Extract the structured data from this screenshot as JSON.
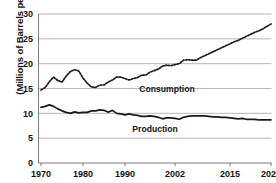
{
  "chart_data": {
    "type": "line",
    "title": "",
    "xlabel": "",
    "ylabel": "(Millions of Barrels per Day)",
    "ylim": [
      0,
      30
    ],
    "yticks": [
      0,
      5,
      10,
      15,
      20,
      25,
      30
    ],
    "ytick_labels": [
      "0",
      "5",
      "10",
      "15",
      "20",
      "25",
      "30"
    ],
    "xticks": [
      1970,
      1980,
      1990,
      2002,
      2015,
      2025
    ],
    "xtick_labels": [
      "1970",
      "1980",
      "1990",
      "2002",
      "2015",
      "2025"
    ],
    "xlim": [
      1970,
      2025
    ],
    "grid": "horizontal",
    "legend_position": "inline-annotation",
    "series": [
      {
        "name": "Consumption",
        "style": "dotted",
        "color": "#1a1a1a",
        "annotation": "Consumption",
        "x": [
          1970,
          1971,
          1972,
          1973,
          1974,
          1975,
          1976,
          1977,
          1978,
          1979,
          1980,
          1981,
          1982,
          1983,
          1984,
          1985,
          1986,
          1987,
          1988,
          1989,
          1990,
          1991,
          1992,
          1993,
          1994,
          1995,
          1996,
          1997,
          1998,
          1999,
          2000,
          2001,
          2002,
          2003,
          2004,
          2005,
          2006,
          2007,
          2008,
          2009,
          2010,
          2011,
          2012,
          2013,
          2014,
          2015,
          2016,
          2017,
          2018,
          2019,
          2020,
          2021,
          2022,
          2023,
          2024,
          2025
        ],
        "values": [
          14.7,
          15.2,
          16.4,
          17.3,
          16.6,
          16.3,
          17.5,
          18.4,
          18.8,
          18.5,
          17.1,
          16.1,
          15.3,
          15.2,
          15.7,
          15.7,
          16.3,
          16.7,
          17.3,
          17.3,
          17.0,
          16.7,
          17.0,
          17.2,
          17.7,
          17.7,
          18.3,
          18.6,
          18.9,
          19.5,
          19.7,
          19.6,
          19.8,
          20.0,
          20.7,
          20.8,
          20.7,
          20.7,
          21.2,
          21.6,
          22.0,
          22.4,
          22.8,
          23.2,
          23.6,
          24.0,
          24.4,
          24.7,
          25.1,
          25.5,
          25.9,
          26.3,
          26.6,
          27.0,
          27.5,
          28.0
        ]
      },
      {
        "name": "Production",
        "style": "solid",
        "color": "#1a1a1a",
        "annotation": "Production",
        "x": [
          1970,
          1971,
          1972,
          1973,
          1974,
          1975,
          1976,
          1977,
          1978,
          1979,
          1980,
          1981,
          1982,
          1983,
          1984,
          1985,
          1986,
          1987,
          1988,
          1989,
          1990,
          1991,
          1992,
          1993,
          1994,
          1995,
          1996,
          1997,
          1998,
          1999,
          2000,
          2001,
          2002,
          2003,
          2004,
          2005,
          2006,
          2007,
          2008,
          2009,
          2010,
          2011,
          2012,
          2013,
          2014,
          2015,
          2016,
          2017,
          2018,
          2019,
          2020,
          2021,
          2022,
          2023,
          2024,
          2025
        ],
        "values": [
          11.2,
          11.4,
          11.7,
          11.4,
          10.9,
          10.5,
          10.2,
          10.0,
          10.3,
          10.1,
          10.2,
          10.2,
          10.5,
          10.5,
          10.7,
          10.6,
          10.2,
          10.6,
          10.0,
          9.9,
          9.7,
          9.9,
          9.7,
          9.6,
          9.4,
          9.4,
          9.5,
          9.4,
          9.2,
          8.9,
          9.1,
          9.1,
          9.0,
          8.8,
          9.2,
          9.4,
          9.5,
          9.5,
          9.5,
          9.5,
          9.4,
          9.3,
          9.3,
          9.2,
          9.2,
          9.1,
          9.0,
          8.9,
          9.0,
          8.8,
          8.8,
          8.8,
          8.7,
          8.7,
          8.7,
          8.7
        ]
      }
    ]
  },
  "axis": {
    "ylabel": "(Millions of Barrels per Day)"
  }
}
